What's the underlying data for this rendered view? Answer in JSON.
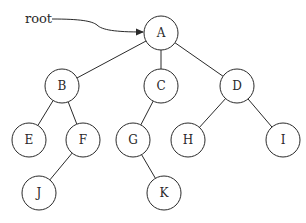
{
  "diagram": {
    "type": "binary-tree",
    "pointer": {
      "label": "root",
      "target": "A"
    },
    "nodes": [
      {
        "id": "A",
        "label": "A",
        "x": 161,
        "y": 33
      },
      {
        "id": "B",
        "label": "B",
        "x": 62,
        "y": 86
      },
      {
        "id": "C",
        "label": "C",
        "x": 161,
        "y": 86
      },
      {
        "id": "D",
        "label": "D",
        "x": 237,
        "y": 86
      },
      {
        "id": "E",
        "label": "E",
        "x": 29,
        "y": 140
      },
      {
        "id": "F",
        "label": "F",
        "x": 83,
        "y": 140
      },
      {
        "id": "G",
        "label": "G",
        "x": 133,
        "y": 140
      },
      {
        "id": "H",
        "label": "H",
        "x": 188,
        "y": 140
      },
      {
        "id": "I",
        "label": "I",
        "x": 283,
        "y": 140
      },
      {
        "id": "J",
        "label": "J",
        "x": 39,
        "y": 193
      },
      {
        "id": "K",
        "label": "K",
        "x": 164,
        "y": 193
      }
    ],
    "edges": [
      [
        "A",
        "B"
      ],
      [
        "A",
        "C"
      ],
      [
        "A",
        "D"
      ],
      [
        "B",
        "E"
      ],
      [
        "B",
        "F"
      ],
      [
        "C",
        "G"
      ],
      [
        "D",
        "H"
      ],
      [
        "D",
        "I"
      ],
      [
        "F",
        "J"
      ],
      [
        "G",
        "K"
      ]
    ],
    "node_radius": 17
  }
}
